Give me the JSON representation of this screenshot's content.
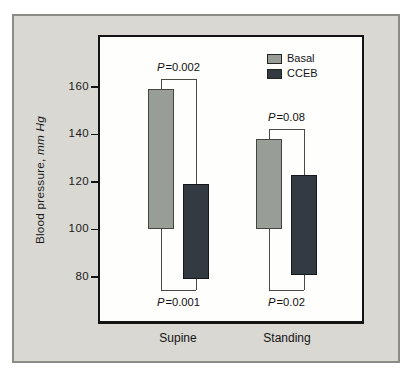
{
  "figure": {
    "ylabel_prefix": "Blood pressure, ",
    "ylabel_italic": "mm Hg"
  },
  "chart_data": {
    "type": "floating-bar",
    "title": "",
    "ylabel": "Blood pressure, mm Hg",
    "ylim": [
      61,
      181
    ],
    "yticks": [
      160,
      140,
      120,
      100,
      80
    ],
    "categories": [
      "Supine",
      "Standing"
    ],
    "legend": [
      {
        "label": "Basal",
        "color": "#989e97"
      },
      {
        "label": "CCEB",
        "color": "#333a41"
      }
    ],
    "groups": [
      {
        "label": "Supine",
        "bars": [
          {
            "series": "Basal",
            "low": 100,
            "high": 159
          },
          {
            "series": "CCEB",
            "low": 79,
            "high": 119
          }
        ],
        "p_top": "P=0.002",
        "p_bottom": "P=0.001"
      },
      {
        "label": "Standing",
        "bars": [
          {
            "series": "Basal",
            "low": 100,
            "high": 138
          },
          {
            "series": "CCEB",
            "low": 81,
            "high": 123
          }
        ],
        "p_top": "P=0.08",
        "p_bottom": "P=0.02"
      }
    ]
  }
}
